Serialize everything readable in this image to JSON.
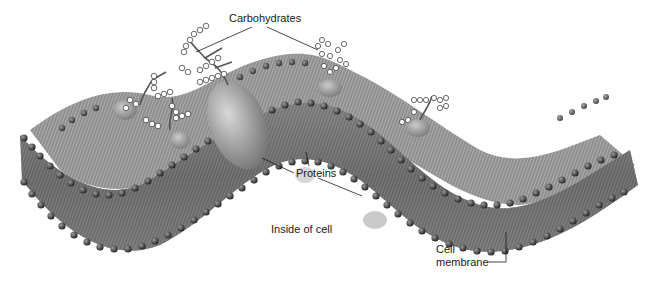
{
  "diagram": {
    "labels": {
      "carbohydrates": "Carbohydrates",
      "proteins": "Proteins",
      "inside_of_cell": "Inside of cell",
      "cell_membrane_line1": "Cell",
      "cell_membrane_line2": "membrane"
    },
    "colors": {
      "background": "#ffffff",
      "phospholipid_head": "#3a3a3a",
      "tail_band": "#6e6e6e",
      "protein": "#9a9a9a",
      "carbohydrate": "#ffffff",
      "leader_line": "#1a1a1a"
    }
  }
}
